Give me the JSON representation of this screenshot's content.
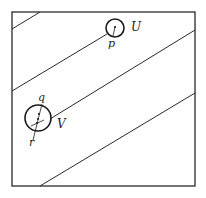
{
  "diagram": {
    "labels": {
      "U": "U",
      "V": "V",
      "p": "p",
      "q": "q",
      "r": "r"
    },
    "box": {
      "x": 12,
      "y": 12,
      "w": 183,
      "h": 174
    },
    "lines": [
      {
        "x1": 12,
        "y1": 29,
        "x2": 40,
        "y2": 12
      },
      {
        "x1": 12,
        "y1": 91,
        "x2": 107,
        "y2": 34
      },
      {
        "x1": 50,
        "y1": 119,
        "x2": 195,
        "y2": 30
      },
      {
        "x1": 40,
        "y1": 186,
        "x2": 195,
        "y2": 93
      }
    ],
    "circles": [
      {
        "name": "U",
        "cx": 115,
        "cy": 28,
        "r": 9
      },
      {
        "name": "V",
        "cx": 38,
        "cy": 118,
        "r": 13
      }
    ],
    "stroke_color": "#2a2a2a"
  }
}
